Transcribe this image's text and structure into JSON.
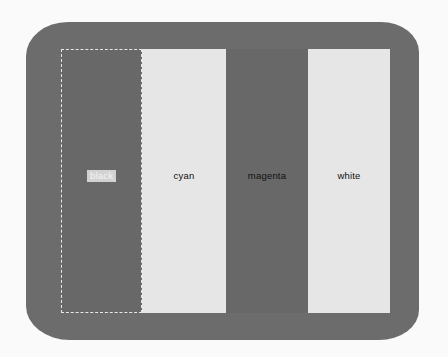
{
  "screen": {
    "frame_color": "#6c6c6c",
    "stripes": [
      {
        "label": "black",
        "color": "#686868",
        "selected": true
      },
      {
        "label": "cyan",
        "color": "#e6e6e6",
        "selected": false
      },
      {
        "label": "magenta",
        "color": "#686868",
        "selected": false
      },
      {
        "label": "white",
        "color": "#e6e6e6",
        "selected": false
      }
    ]
  }
}
